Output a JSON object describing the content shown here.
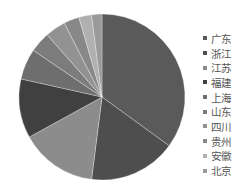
{
  "chart_data": {
    "type": "pie",
    "title": "",
    "categories": [
      "广东",
      "浙江",
      "江苏",
      "福建",
      "上海",
      "山东",
      "四川",
      "贵州",
      "安徽",
      "北京"
    ],
    "values": [
      35,
      17,
      15,
      11.5,
      6,
      4,
      4,
      3,
      2.5,
      2
    ],
    "colors": [
      "#5a5a5a",
      "#4e4e4e",
      "#8c8c8c",
      "#404040",
      "#6e6e6e",
      "#7c7c7c",
      "#929292",
      "#888888",
      "#b0b0b0",
      "#9a9a9a"
    ],
    "legend_position": "right",
    "start_angle_deg": 0,
    "direction": "clockwise",
    "center": [
      102,
      97
    ],
    "radius": 83
  },
  "legend": {
    "items": [
      {
        "label": "广东"
      },
      {
        "label": "浙江"
      },
      {
        "label": "江苏"
      },
      {
        "label": "福建"
      },
      {
        "label": "上海"
      },
      {
        "label": "山东"
      },
      {
        "label": "四川"
      },
      {
        "label": "贵州"
      },
      {
        "label": "安徽"
      },
      {
        "label": "北京"
      }
    ]
  }
}
